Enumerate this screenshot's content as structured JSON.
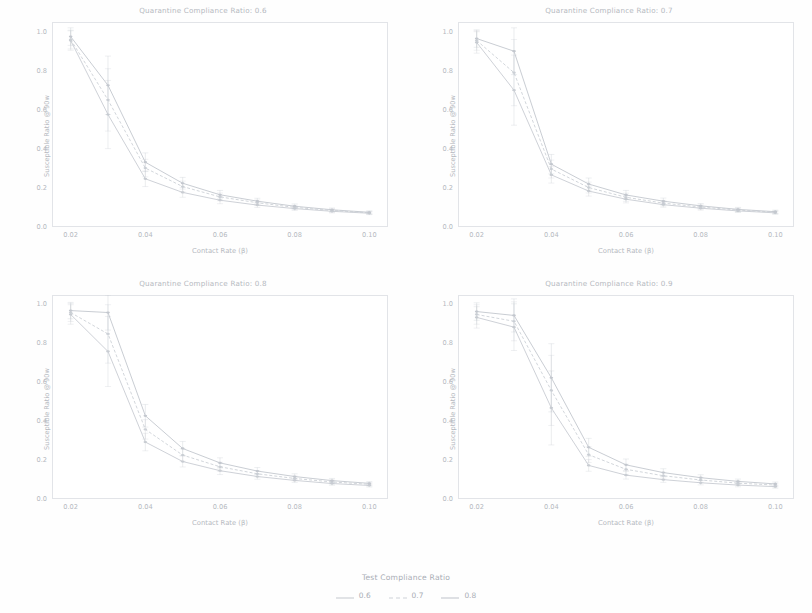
{
  "figure": {
    "xlabel": "Contact Rate (β)",
    "ylabel": "Susceptible Ratio @ 90w",
    "background": "#ffffff",
    "axis_color": "#e2e4e8",
    "text_color": "#b5b9c0"
  },
  "legend": {
    "title": "Test Compliance Ratio",
    "items": [
      {
        "label": "0.6",
        "color": "#c8ccd2",
        "dash": "none"
      },
      {
        "label": "0.7",
        "color": "#cdd1d7",
        "dash": "dashed"
      },
      {
        "label": "0.8",
        "color": "#c3c7ce",
        "dash": "none"
      }
    ]
  },
  "chart_data": [
    {
      "type": "line",
      "title": "Quarantine Compliance Ratio: 0.6",
      "xlabel": "Contact Rate (β)",
      "ylabel": "Susceptible Ratio @ 90w",
      "x": [
        0.02,
        0.03,
        0.04,
        0.05,
        0.06,
        0.07,
        0.08,
        0.09,
        0.1
      ],
      "xlim": [
        0.015,
        0.105
      ],
      "ylim": [
        0.0,
        1.05
      ],
      "xticks": [
        "0.02",
        "0.04",
        "0.06",
        "0.08",
        "0.10"
      ],
      "xtick_values": [
        0.02,
        0.04,
        0.06,
        0.08,
        0.1
      ],
      "yticks": [
        "0.0",
        "0.2",
        "0.4",
        "0.6",
        "0.8",
        "1.0"
      ],
      "ytick_values": [
        0.0,
        0.2,
        0.4,
        0.6,
        0.8,
        1.0
      ],
      "grid": false,
      "legend_position": "below-figure",
      "series": [
        {
          "name": "0.6",
          "color": "#c8ccd2",
          "dash": "none",
          "values": [
            0.955,
            0.575,
            0.245,
            0.175,
            0.135,
            0.11,
            0.092,
            0.078,
            0.068
          ],
          "err": [
            0.05,
            0.175,
            0.04,
            0.025,
            0.018,
            0.012,
            0.01,
            0.008,
            0.007
          ]
        },
        {
          "name": "0.7",
          "color": "#cdd1d7",
          "dash": "dashed",
          "values": [
            0.96,
            0.65,
            0.3,
            0.205,
            0.152,
            0.122,
            0.098,
            0.082,
            0.07
          ],
          "err": [
            0.048,
            0.16,
            0.045,
            0.028,
            0.02,
            0.014,
            0.011,
            0.009,
            0.007
          ]
        },
        {
          "name": "0.8",
          "color": "#c3c7ce",
          "dash": "none",
          "values": [
            0.975,
            0.725,
            0.33,
            0.222,
            0.163,
            0.13,
            0.104,
            0.086,
            0.073
          ],
          "err": [
            0.045,
            0.15,
            0.048,
            0.03,
            0.022,
            0.015,
            0.012,
            0.009,
            0.008
          ]
        }
      ]
    },
    {
      "type": "line",
      "title": "Quarantine Compliance Ratio: 0.7",
      "xlabel": "Contact Rate (β)",
      "ylabel": "Susceptible Ratio @ 90w",
      "x": [
        0.02,
        0.03,
        0.04,
        0.05,
        0.06,
        0.07,
        0.08,
        0.09,
        0.1
      ],
      "xlim": [
        0.015,
        0.105
      ],
      "ylim": [
        0.0,
        1.05
      ],
      "xticks": [
        "0.02",
        "0.04",
        "0.06",
        "0.08",
        "0.10"
      ],
      "xtick_values": [
        0.02,
        0.04,
        0.06,
        0.08,
        0.1
      ],
      "yticks": [
        "0.0",
        "0.2",
        "0.4",
        "0.6",
        "0.8",
        "1.0"
      ],
      "ytick_values": [
        0.0,
        0.2,
        0.4,
        0.6,
        0.8,
        1.0
      ],
      "grid": false,
      "legend_position": "below-figure",
      "series": [
        {
          "name": "0.6",
          "color": "#c8ccd2",
          "dash": "none",
          "values": [
            0.945,
            0.7,
            0.265,
            0.182,
            0.14,
            0.112,
            0.094,
            0.08,
            0.07
          ],
          "err": [
            0.055,
            0.18,
            0.042,
            0.026,
            0.019,
            0.013,
            0.01,
            0.008,
            0.007
          ]
        },
        {
          "name": "0.7",
          "color": "#cdd1d7",
          "dash": "dashed",
          "values": [
            0.955,
            0.79,
            0.295,
            0.2,
            0.15,
            0.12,
            0.1,
            0.084,
            0.073
          ],
          "err": [
            0.05,
            0.17,
            0.046,
            0.028,
            0.021,
            0.014,
            0.011,
            0.009,
            0.008
          ]
        },
        {
          "name": "0.8",
          "color": "#c3c7ce",
          "dash": "none",
          "values": [
            0.965,
            0.9,
            0.32,
            0.218,
            0.162,
            0.13,
            0.106,
            0.088,
            0.076
          ],
          "err": [
            0.045,
            0.12,
            0.05,
            0.031,
            0.023,
            0.016,
            0.012,
            0.01,
            0.008
          ]
        }
      ]
    },
    {
      "type": "line",
      "title": "Quarantine Compliance Ratio: 0.8",
      "xlabel": "Contact Rate (β)",
      "ylabel": "Susceptible Ratio @ 90w",
      "x": [
        0.02,
        0.03,
        0.04,
        0.05,
        0.06,
        0.07,
        0.08,
        0.09,
        0.1
      ],
      "xlim": [
        0.015,
        0.105
      ],
      "ylim": [
        0.0,
        1.05
      ],
      "xticks": [
        "0.02",
        "0.04",
        "0.06",
        "0.08",
        "0.10"
      ],
      "xtick_values": [
        0.02,
        0.04,
        0.06,
        0.08,
        0.1
      ],
      "yticks": [
        "0.0",
        "0.2",
        "0.4",
        "0.6",
        "0.8",
        "1.0"
      ],
      "ytick_values": [
        0.0,
        0.2,
        0.4,
        0.6,
        0.8,
        1.0
      ],
      "grid": false,
      "legend_position": "below-figure",
      "series": [
        {
          "name": "0.6",
          "color": "#c8ccd2",
          "dash": "none",
          "values": [
            0.95,
            0.76,
            0.295,
            0.195,
            0.148,
            0.118,
            0.098,
            0.082,
            0.072
          ],
          "err": [
            0.05,
            0.18,
            0.045,
            0.028,
            0.02,
            0.014,
            0.011,
            0.009,
            0.008
          ]
        },
        {
          "name": "0.7",
          "color": "#cdd1d7",
          "dash": "dashed",
          "values": [
            0.96,
            0.85,
            0.36,
            0.228,
            0.168,
            0.132,
            0.108,
            0.09,
            0.078
          ],
          "err": [
            0.046,
            0.15,
            0.05,
            0.032,
            0.023,
            0.016,
            0.012,
            0.01,
            0.008
          ]
        },
        {
          "name": "0.8",
          "color": "#c3c7ce",
          "dash": "none",
          "values": [
            0.97,
            0.96,
            0.43,
            0.262,
            0.188,
            0.146,
            0.118,
            0.097,
            0.083
          ],
          "err": [
            0.042,
            0.09,
            0.058,
            0.036,
            0.026,
            0.018,
            0.014,
            0.011,
            0.009
          ]
        }
      ]
    },
    {
      "type": "line",
      "title": "Quarantine Compliance Ratio: 0.9",
      "xlabel": "Contact Rate (β)",
      "ylabel": "Susceptible Ratio @ 90w",
      "x": [
        0.02,
        0.03,
        0.04,
        0.05,
        0.06,
        0.07,
        0.08,
        0.09,
        0.1
      ],
      "xlim": [
        0.015,
        0.105
      ],
      "ylim": [
        0.0,
        1.05
      ],
      "xticks": [
        "0.02",
        "0.04",
        "0.06",
        "0.08",
        "0.10"
      ],
      "xtick_values": [
        0.02,
        0.04,
        0.06,
        0.08,
        0.1
      ],
      "yticks": [
        "0.0",
        "0.2",
        "0.4",
        "0.6",
        "0.8",
        "1.0"
      ],
      "ytick_values": [
        0.0,
        0.2,
        0.4,
        0.6,
        0.8,
        1.0
      ],
      "grid": false,
      "legend_position": "below-figure",
      "series": [
        {
          "name": "0.6",
          "color": "#c8ccd2",
          "dash": "none",
          "values": [
            0.935,
            0.885,
            0.47,
            0.175,
            0.125,
            0.102,
            0.086,
            0.074,
            0.066
          ],
          "err": [
            0.055,
            0.12,
            0.19,
            0.03,
            0.02,
            0.014,
            0.011,
            0.009,
            0.008
          ]
        },
        {
          "name": "0.7",
          "color": "#cdd1d7",
          "dash": "dashed",
          "values": [
            0.95,
            0.915,
            0.56,
            0.23,
            0.155,
            0.122,
            0.1,
            0.084,
            0.074
          ],
          "err": [
            0.05,
            0.1,
            0.18,
            0.04,
            0.026,
            0.017,
            0.013,
            0.01,
            0.009
          ]
        },
        {
          "name": "0.8",
          "color": "#c3c7ce",
          "dash": "none",
          "values": [
            0.965,
            0.945,
            0.625,
            0.268,
            0.178,
            0.138,
            0.112,
            0.093,
            0.08
          ],
          "err": [
            0.045,
            0.085,
            0.175,
            0.046,
            0.03,
            0.02,
            0.015,
            0.012,
            0.01
          ]
        }
      ]
    }
  ]
}
